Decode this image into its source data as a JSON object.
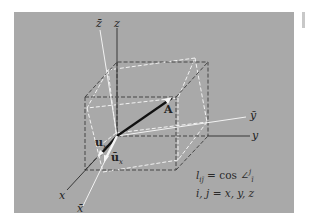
{
  "figure": {
    "background_color": "#a9a9a9",
    "page_color": "#ffffff",
    "axes_original": {
      "x": "x",
      "y": "y",
      "z": "z"
    },
    "axes_rotated": {
      "x": "x̄",
      "y": "ȳ",
      "z": "z̄"
    },
    "point_label": "A",
    "unit_vectors": {
      "original": "u",
      "original_sub": "x",
      "rotated": "ū",
      "rotated_sub": "x"
    },
    "formula": {
      "line1_lhs": "l",
      "line1_sub": "ij̄",
      "line1_eq": " = cos ",
      "line1_angle": "∠",
      "line1_sup": "j",
      "line1_angle_sub": "ī",
      "line2": "i, j = x, y, z"
    }
  }
}
